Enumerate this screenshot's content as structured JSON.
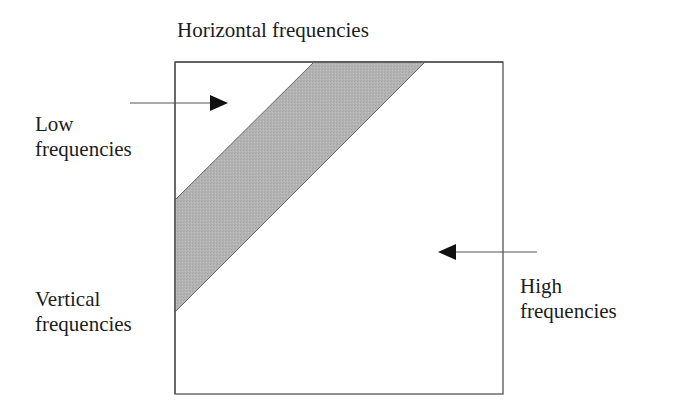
{
  "title": "Horizontal frequencies",
  "labels": {
    "low": {
      "line1": "Low",
      "line2": "frequencies"
    },
    "vertical": {
      "line1": "Vertical",
      "line2": "frequencies"
    },
    "high": {
      "line1": "High",
      "line2": "frequencies"
    }
  },
  "diagram": {
    "box": {
      "x": 175,
      "y": 62,
      "width": 328,
      "height": 332,
      "stroke": "#555555"
    },
    "band": {
      "fill": "#b3b3b3",
      "stroke": "#666666",
      "points": [
        [
          314,
          62
        ],
        [
          425,
          62
        ],
        [
          175,
          312
        ],
        [
          175,
          200
        ]
      ],
      "description": "Shaded diagonal band of low frequencies"
    },
    "arrows": [
      {
        "name": "low-frequencies-arrow",
        "from": [
          130,
          103
        ],
        "to": [
          228,
          103
        ],
        "direction": "right"
      },
      {
        "name": "high-frequencies-arrow",
        "from": [
          537,
          252
        ],
        "to": [
          438,
          252
        ],
        "direction": "left"
      }
    ],
    "colors": {
      "text": "#1c1c1c",
      "line": "#555555",
      "band_fill": "#b3b3b3",
      "arrow_head": "#111111"
    }
  }
}
